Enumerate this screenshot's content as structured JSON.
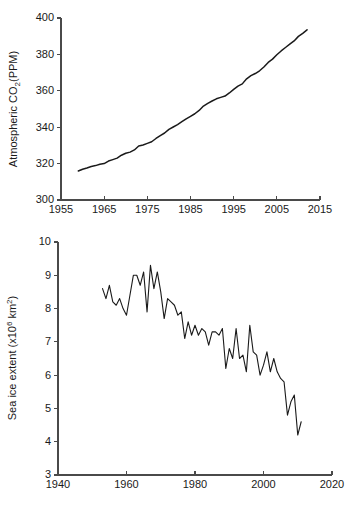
{
  "figure": {
    "background_color": "#ffffff",
    "line_color": "#1a1a1a",
    "axis_color": "#4a4a4a"
  },
  "chart_data": [
    {
      "id": "co2",
      "type": "line",
      "title": "",
      "xlabel": "",
      "ylabel": "Atmospheric CO2(PPM)",
      "ylabel_parts": {
        "pre": "Atmospheric CO",
        "sub": "2",
        "post": "(PPM)"
      },
      "xlim": [
        1955,
        2015
      ],
      "ylim": [
        300,
        400
      ],
      "xticks": [
        1955,
        1965,
        1975,
        1985,
        1995,
        2005,
        2015
      ],
      "yticks": [
        300,
        320,
        340,
        360,
        380,
        400
      ],
      "grid": false,
      "legend": "none",
      "x": [
        1959,
        1960,
        1961,
        1962,
        1963,
        1964,
        1965,
        1966,
        1967,
        1968,
        1969,
        1970,
        1971,
        1972,
        1973,
        1974,
        1975,
        1976,
        1977,
        1978,
        1979,
        1980,
        1981,
        1982,
        1983,
        1984,
        1985,
        1986,
        1987,
        1988,
        1989,
        1990,
        1991,
        1992,
        1993,
        1994,
        1995,
        1996,
        1997,
        1998,
        1999,
        2000,
        2001,
        2002,
        2003,
        2004,
        2005,
        2006,
        2007,
        2008,
        2009,
        2010,
        2011,
        2012
      ],
      "values": [
        315.9,
        316.9,
        317.6,
        318.4,
        318.9,
        319.6,
        320.0,
        321.4,
        322.2,
        323.0,
        324.6,
        325.7,
        326.3,
        327.5,
        329.7,
        330.2,
        331.1,
        332.0,
        333.8,
        335.4,
        336.8,
        338.8,
        340.1,
        341.4,
        343.0,
        344.6,
        346.0,
        347.4,
        349.2,
        351.6,
        353.1,
        354.4,
        355.6,
        356.4,
        357.1,
        358.8,
        360.8,
        362.6,
        363.8,
        366.6,
        368.3,
        369.5,
        371.0,
        373.1,
        375.6,
        377.4,
        379.8,
        381.9,
        383.8,
        385.6,
        387.4,
        389.9,
        391.6,
        393.5
      ]
    },
    {
      "id": "sea-ice",
      "type": "line",
      "title": "",
      "xlabel": "",
      "ylabel": "Sea ice extent (x10^6 km^2)",
      "ylabel_parts": {
        "pre": "Sea ice extent (x10",
        "sup": "6",
        "mid": " km",
        "sup2": "2",
        "post": ")"
      },
      "xlim": [
        1940,
        2020
      ],
      "ylim": [
        3,
        10
      ],
      "xticks": [
        1940,
        1960,
        1980,
        2000,
        2020
      ],
      "yticks": [
        3,
        4,
        5,
        6,
        7,
        8,
        9,
        10
      ],
      "grid": false,
      "legend": "none",
      "x": [
        1953,
        1954,
        1955,
        1956,
        1957,
        1958,
        1959,
        1960,
        1961,
        1962,
        1963,
        1964,
        1965,
        1966,
        1967,
        1968,
        1969,
        1970,
        1971,
        1972,
        1973,
        1974,
        1975,
        1976,
        1977,
        1978,
        1979,
        1980,
        1981,
        1982,
        1983,
        1984,
        1985,
        1986,
        1987,
        1988,
        1989,
        1990,
        1991,
        1992,
        1993,
        1994,
        1995,
        1996,
        1997,
        1998,
        1999,
        2000,
        2001,
        2002,
        2003,
        2004,
        2005,
        2006,
        2007,
        2008,
        2009,
        2010,
        2011
      ],
      "values": [
        8.6,
        8.3,
        8.7,
        8.2,
        8.1,
        8.3,
        8.0,
        7.8,
        8.4,
        9.0,
        9.0,
        8.7,
        9.1,
        7.9,
        9.3,
        8.6,
        9.1,
        8.5,
        7.7,
        8.3,
        8.2,
        8.1,
        7.8,
        7.9,
        7.1,
        7.6,
        7.2,
        7.5,
        7.2,
        7.4,
        7.3,
        6.9,
        7.3,
        7.3,
        7.2,
        7.4,
        6.2,
        6.8,
        6.5,
        7.4,
        6.5,
        6.6,
        6.1,
        7.5,
        6.7,
        6.6,
        6.0,
        6.3,
        6.7,
        6.1,
        6.5,
        6.1,
        5.9,
        5.8,
        4.8,
        5.2,
        5.4,
        4.2,
        4.6
      ]
    }
  ]
}
